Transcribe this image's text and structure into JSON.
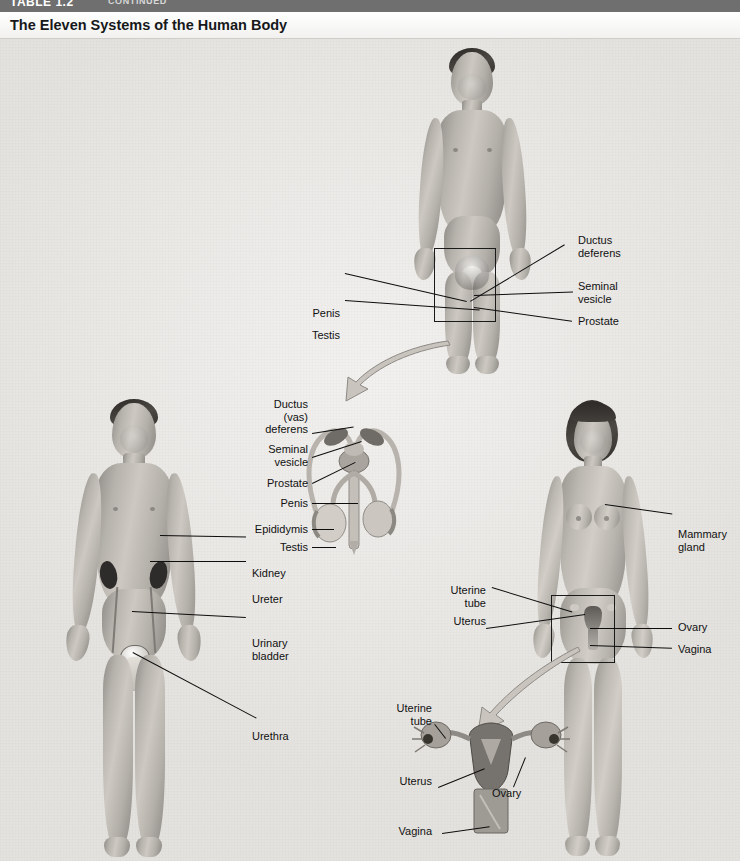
{
  "table_bar": {
    "table_label": "TABLE 1.2",
    "continued_label": "CONTINUED"
  },
  "header": {
    "title": "The Eleven Systems of the Human Body"
  },
  "figures": [
    {
      "id": "male-reproductive-figure",
      "system": "Male Reproductive System",
      "labels": [
        {
          "name": "penis",
          "text": "Penis"
        },
        {
          "name": "testis",
          "text": "Testis"
        },
        {
          "name": "ductus-deferens",
          "text": "Ductus\ndeferens"
        },
        {
          "name": "seminal-vesicle",
          "text": "Seminal\nvesicle"
        },
        {
          "name": "prostate",
          "text": "Prostate"
        }
      ]
    },
    {
      "id": "male-reproductive-inset",
      "system": "Male Reproductive Organs Detail",
      "labels": [
        {
          "name": "ductus-vas-deferens",
          "text": "Ductus\n(vas)\ndeferens"
        },
        {
          "name": "seminal-vesicle",
          "text": "Seminal\nvesicle"
        },
        {
          "name": "prostate",
          "text": "Prostate"
        },
        {
          "name": "penis",
          "text": "Penis"
        },
        {
          "name": "epididymis",
          "text": "Epididymis"
        },
        {
          "name": "testis",
          "text": "Testis"
        }
      ]
    },
    {
      "id": "urinary-figure",
      "system": "Urinary System",
      "labels": [
        {
          "name": "kidney",
          "text": "Kidney"
        },
        {
          "name": "ureter",
          "text": "Ureter"
        },
        {
          "name": "urinary-bladder",
          "text": "Urinary\nbladder"
        },
        {
          "name": "urethra",
          "text": "Urethra"
        }
      ]
    },
    {
      "id": "female-reproductive-figure",
      "system": "Female Reproductive System",
      "labels": [
        {
          "name": "mammary-gland",
          "text": "Mammary\ngland"
        },
        {
          "name": "uterine-tube",
          "text": "Uterine\ntube"
        },
        {
          "name": "uterus",
          "text": "Uterus"
        },
        {
          "name": "ovary",
          "text": "Ovary"
        },
        {
          "name": "vagina",
          "text": "Vagina"
        }
      ]
    },
    {
      "id": "female-reproductive-inset",
      "system": "Female Reproductive Organs Detail",
      "labels": [
        {
          "name": "uterine-tube",
          "text": "Uterine\ntube"
        },
        {
          "name": "uterus",
          "text": "Uterus"
        },
        {
          "name": "ovary",
          "text": "Ovary"
        },
        {
          "name": "vagina",
          "text": "Vagina"
        }
      ]
    }
  ],
  "colors": {
    "table_bar": "#6f6f6f",
    "title_text": "#16181a",
    "canvas_background": "#eceae7",
    "label_text": "#111111",
    "leader_line": "#0d0d0d",
    "kidney": "#2e2c2a",
    "arrow_fill": "#c9c5be"
  }
}
